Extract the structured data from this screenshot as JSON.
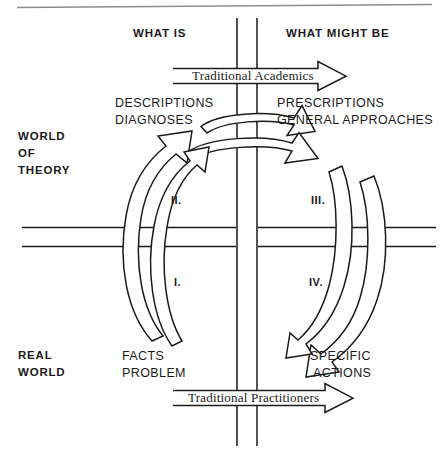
{
  "figure": {
    "title_top_rule": "",
    "quadrant_headers": {
      "left": "WHAT IS",
      "right": "WHAT MIGHT BE"
    },
    "axis_labels": {
      "upper_left_zone": "WORLD\nOF\nTHEORY",
      "world_of_theory_line1": "WORLD",
      "world_of_theory_line2": "OF",
      "world_of_theory_line3": "THEORY",
      "real_world_line1": "REAL",
      "real_world_line2": "WORLD"
    },
    "content_labels": {
      "descriptions": "DESCRIPTIONS",
      "diagnoses": "DIAGNOSES",
      "prescriptions": "PRESCRIPTIONS",
      "general_approaches": "GENERAL APPROACHES",
      "facts": "FACTS",
      "problem": "PROBLEM",
      "specific": "SPECIFIC",
      "actions": "ACTIONS"
    },
    "banner_arrows": [
      {
        "id": "traditional-academics",
        "label": "Traditional Academics",
        "direction": "right"
      },
      {
        "id": "traditional-practitioners",
        "label": "Traditional Practitioners",
        "direction": "right"
      }
    ],
    "quadrant_markers": [
      {
        "id": "marker-i",
        "label": "I."
      },
      {
        "id": "marker-ii",
        "label": "II."
      },
      {
        "id": "marker-iii",
        "label": "III."
      },
      {
        "id": "marker-iv",
        "label": "IV."
      }
    ],
    "colors": {
      "ink": "#1a1a1a",
      "rule": "#8c8c8c",
      "background": "#ffffff"
    }
  }
}
